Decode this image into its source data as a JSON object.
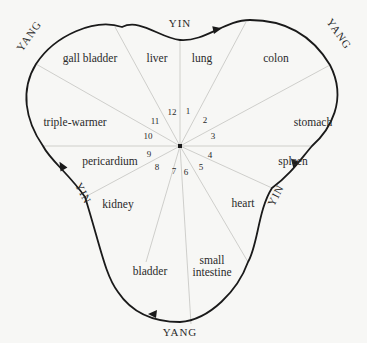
{
  "diagram": {
    "type": "organ-clock",
    "center_dot": "center",
    "phases": [
      {
        "label": "YIN",
        "position": "top"
      },
      {
        "label": "YANG",
        "position": "upper-right"
      },
      {
        "label": "YIN",
        "position": "lower-right"
      },
      {
        "label": "YANG",
        "position": "bottom"
      },
      {
        "label": "YIN",
        "position": "lower-left"
      },
      {
        "label": "YANG",
        "position": "upper-left"
      }
    ],
    "organs": [
      {
        "name": "liver",
        "hour": "12"
      },
      {
        "name": "lung",
        "hour": "1"
      },
      {
        "name": "colon",
        "hour": "2"
      },
      {
        "name": "stomach",
        "hour": "3"
      },
      {
        "name": "spleen",
        "hour": "4"
      },
      {
        "name": "heart",
        "hour": "5"
      },
      {
        "name": "small",
        "name2": "intestine",
        "hour": "6"
      },
      {
        "name": "bladder",
        "hour": "7"
      },
      {
        "name": "kidney",
        "hour": "8"
      },
      {
        "name": "pericardium",
        "hour": "9"
      },
      {
        "name": "triple-warmer",
        "hour": "10"
      },
      {
        "name": "gall bladder",
        "hour": "11"
      }
    ],
    "colors": {
      "outline": "#1a1a1a",
      "rays": "#c9c9c6",
      "text": "#2a2a2a",
      "background": "#f7f7f5"
    }
  }
}
